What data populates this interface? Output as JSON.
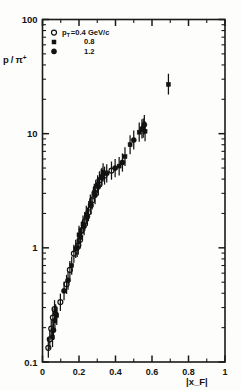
{
  "figure": {
    "name": "proton-to-pion-ratio-vs-xf"
  },
  "chart_data": {
    "type": "scatter",
    "title": "",
    "subtitle": "",
    "xlabel": "|x_F|",
    "ylabel": "p / π⁺",
    "ylabel_numerator": "p",
    "ylabel_slash": "/",
    "ylabel_denominator": "π",
    "ylabel_denominator_sup": "+",
    "yscale": "log",
    "xscale": "linear",
    "xlim": [
      0,
      1
    ],
    "ylim": [
      0.1,
      100
    ],
    "grid": false,
    "legend_position": "top-left",
    "x_ticks_major": [
      0,
      0.2,
      0.4,
      0.6,
      0.8,
      1
    ],
    "x_ticklabels": [
      "0",
      "0.2",
      "0.4",
      "0.6",
      "0.8",
      "1"
    ],
    "x_ticks_minor": [
      0.1,
      0.3,
      0.5,
      0.7,
      0.9
    ],
    "y_ticks_major": [
      0.1,
      1,
      10,
      100
    ],
    "y_ticklabels": [
      "0.1",
      "1",
      "10",
      "100"
    ],
    "legend": [
      {
        "marker": "open-circle",
        "label_main": "p",
        "label_sub": "T",
        "label_rest": "=0.4 GeV/c",
        "value": "0.4",
        "units": "GeV/c"
      },
      {
        "marker": "small-square",
        "label_main": "",
        "label_sub": "",
        "label_rest": "0.8",
        "value": "0.8",
        "units": ""
      },
      {
        "marker": "filled-circle",
        "label_main": "",
        "label_sub": "",
        "label_rest": "1.2",
        "value": "1.2",
        "units": ""
      }
    ],
    "series": [
      {
        "name": "pT = 0.4 GeV/c",
        "marker": "open-circle",
        "points": [
          {
            "x": 0.032,
            "y": 0.133,
            "yerr_lo": 0.024,
            "yerr_hi": 0.03
          },
          {
            "x": 0.04,
            "y": 0.158,
            "yerr_lo": 0.028,
            "yerr_hi": 0.034
          },
          {
            "x": 0.048,
            "y": 0.196,
            "yerr_lo": 0.034,
            "yerr_hi": 0.04
          },
          {
            "x": 0.057,
            "y": 0.245,
            "yerr_lo": 0.042,
            "yerr_hi": 0.05
          },
          {
            "x": 0.066,
            "y": 0.29,
            "yerr_lo": 0.05,
            "yerr_hi": 0.058
          },
          {
            "x": 0.098,
            "y": 0.335,
            "yerr_lo": 0.055,
            "yerr_hi": 0.062
          },
          {
            "x": 0.15,
            "y": 0.64,
            "yerr_lo": 0.11,
            "yerr_hi": 0.125
          },
          {
            "x": 0.172,
            "y": 0.89,
            "yerr_lo": 0.15,
            "yerr_hi": 0.175
          },
          {
            "x": 0.196,
            "y": 1.05,
            "yerr_lo": 0.18,
            "yerr_hi": 0.21
          },
          {
            "x": 0.214,
            "y": 1.42,
            "yerr_lo": 0.24,
            "yerr_hi": 0.28
          },
          {
            "x": 0.232,
            "y": 1.7,
            "yerr_lo": 0.29,
            "yerr_hi": 0.34
          },
          {
            "x": 0.252,
            "y": 2.05,
            "yerr_lo": 0.34,
            "yerr_hi": 0.4
          },
          {
            "x": 0.272,
            "y": 2.6,
            "yerr_lo": 0.43,
            "yerr_hi": 0.51
          },
          {
            "x": 0.292,
            "y": 3.3,
            "yerr_lo": 0.56,
            "yerr_hi": 0.65
          },
          {
            "x": 0.312,
            "y": 3.9,
            "yerr_lo": 0.65,
            "yerr_hi": 0.78
          },
          {
            "x": 0.34,
            "y": 4.3,
            "yerr_lo": 0.72,
            "yerr_hi": 0.85
          },
          {
            "x": 0.378,
            "y": 4.75,
            "yerr_lo": 0.8,
            "yerr_hi": 0.95
          },
          {
            "x": 0.132,
            "y": 0.48,
            "yerr_lo": 0.085,
            "yerr_hi": 0.1
          },
          {
            "x": 0.206,
            "y": 1.18,
            "yerr_lo": 0.2,
            "yerr_hi": 0.235
          }
        ]
      },
      {
        "name": "pT = 0.8 GeV/c",
        "marker": "small-square",
        "points": [
          {
            "x": 0.055,
            "y": 0.165,
            "yerr_lo": 0.03,
            "yerr_hi": 0.036
          },
          {
            "x": 0.068,
            "y": 0.23,
            "yerr_lo": 0.04,
            "yerr_hi": 0.048
          },
          {
            "x": 0.078,
            "y": 0.255,
            "yerr_lo": 0.044,
            "yerr_hi": 0.052
          },
          {
            "x": 0.16,
            "y": 0.7,
            "yerr_lo": 0.12,
            "yerr_hi": 0.14
          },
          {
            "x": 0.182,
            "y": 0.98,
            "yerr_lo": 0.165,
            "yerr_hi": 0.195
          },
          {
            "x": 0.2,
            "y": 1.3,
            "yerr_lo": 0.22,
            "yerr_hi": 0.26
          },
          {
            "x": 0.222,
            "y": 1.6,
            "yerr_lo": 0.27,
            "yerr_hi": 0.32
          },
          {
            "x": 0.24,
            "y": 1.95,
            "yerr_lo": 0.33,
            "yerr_hi": 0.39
          },
          {
            "x": 0.262,
            "y": 2.45,
            "yerr_lo": 0.41,
            "yerr_hi": 0.48
          },
          {
            "x": 0.284,
            "y": 3.05,
            "yerr_lo": 0.51,
            "yerr_hi": 0.6
          },
          {
            "x": 0.302,
            "y": 3.6,
            "yerr_lo": 0.6,
            "yerr_hi": 0.72
          },
          {
            "x": 0.322,
            "y": 4.1,
            "yerr_lo": 0.69,
            "yerr_hi": 0.82
          },
          {
            "x": 0.332,
            "y": 4.6,
            "yerr_lo": 0.78,
            "yerr_hi": 0.92
          },
          {
            "x": 0.42,
            "y": 5.2,
            "yerr_lo": 0.9,
            "yerr_hi": 1.05
          },
          {
            "x": 0.452,
            "y": 6.3,
            "yerr_lo": 1.1,
            "yerr_hi": 1.3
          },
          {
            "x": 0.48,
            "y": 8.0,
            "yerr_lo": 1.4,
            "yerr_hi": 1.7
          },
          {
            "x": 0.53,
            "y": 10.3,
            "yerr_lo": 1.8,
            "yerr_hi": 2.2
          },
          {
            "x": 0.552,
            "y": 11.2,
            "yerr_lo": 2.0,
            "yerr_hi": 2.4
          },
          {
            "x": 0.562,
            "y": 10.5,
            "yerr_lo": 1.9,
            "yerr_hi": 2.3
          },
          {
            "x": 0.69,
            "y": 27.0,
            "yerr_lo": 5.0,
            "yerr_hi": 6.5
          }
        ]
      },
      {
        "name": "pT = 1.2 GeV/c",
        "marker": "filled-circle",
        "points": [
          {
            "x": 0.06,
            "y": 0.19,
            "yerr_lo": 0.034,
            "yerr_hi": 0.04
          },
          {
            "x": 0.072,
            "y": 0.265,
            "yerr_lo": 0.046,
            "yerr_hi": 0.055
          },
          {
            "x": 0.118,
            "y": 0.42,
            "yerr_lo": 0.072,
            "yerr_hi": 0.085
          },
          {
            "x": 0.14,
            "y": 0.52,
            "yerr_lo": 0.09,
            "yerr_hi": 0.105
          },
          {
            "x": 0.19,
            "y": 1.0,
            "yerr_lo": 0.17,
            "yerr_hi": 0.2
          },
          {
            "x": 0.208,
            "y": 1.25,
            "yerr_lo": 0.21,
            "yerr_hi": 0.25
          },
          {
            "x": 0.228,
            "y": 1.55,
            "yerr_lo": 0.26,
            "yerr_hi": 0.31
          },
          {
            "x": 0.246,
            "y": 1.88,
            "yerr_lo": 0.32,
            "yerr_hi": 0.375
          },
          {
            "x": 0.266,
            "y": 2.35,
            "yerr_lo": 0.395,
            "yerr_hi": 0.47
          },
          {
            "x": 0.288,
            "y": 2.9,
            "yerr_lo": 0.49,
            "yerr_hi": 0.58
          },
          {
            "x": 0.306,
            "y": 3.45,
            "yerr_lo": 0.58,
            "yerr_hi": 0.69
          },
          {
            "x": 0.326,
            "y": 4.2,
            "yerr_lo": 0.7,
            "yerr_hi": 0.84
          },
          {
            "x": 0.352,
            "y": 4.5,
            "yerr_lo": 0.76,
            "yerr_hi": 0.9
          },
          {
            "x": 0.398,
            "y": 5.0,
            "yerr_lo": 0.85,
            "yerr_hi": 1.0
          },
          {
            "x": 0.438,
            "y": 5.6,
            "yerr_lo": 0.95,
            "yerr_hi": 1.12
          },
          {
            "x": 0.5,
            "y": 8.8,
            "yerr_lo": 1.55,
            "yerr_hi": 1.85
          },
          {
            "x": 0.545,
            "y": 11.0,
            "yerr_lo": 1.95,
            "yerr_hi": 2.35
          },
          {
            "x": 0.558,
            "y": 12.0,
            "yerr_lo": 2.1,
            "yerr_hi": 2.6
          }
        ]
      }
    ]
  }
}
